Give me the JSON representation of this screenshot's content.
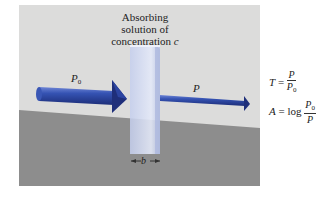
{
  "diagram": {
    "title_lines": [
      "Absorbing",
      "solution of",
      "concentration"
    ],
    "concentration_symbol": "c",
    "incident_beam": {
      "symbol": "P",
      "subscript": "0"
    },
    "transmitted_beam": {
      "symbol": "P"
    },
    "path_length": {
      "symbol": "b"
    },
    "formulas": {
      "transmittance": {
        "lhs": "T",
        "eq": "=",
        "num": "P",
        "den": "P",
        "den_sub": "0"
      },
      "absorbance": {
        "lhs": "A",
        "eq": "=",
        "fn": "log",
        "num": "P",
        "num_sub": "0",
        "den": "P"
      }
    },
    "colors": {
      "wall": "#dcdcdb",
      "floor": "#8d8d8d",
      "beam": "#2d4aa0",
      "beam_dark": "#1a2a6b",
      "cuvette": "#c8d2ee"
    }
  }
}
